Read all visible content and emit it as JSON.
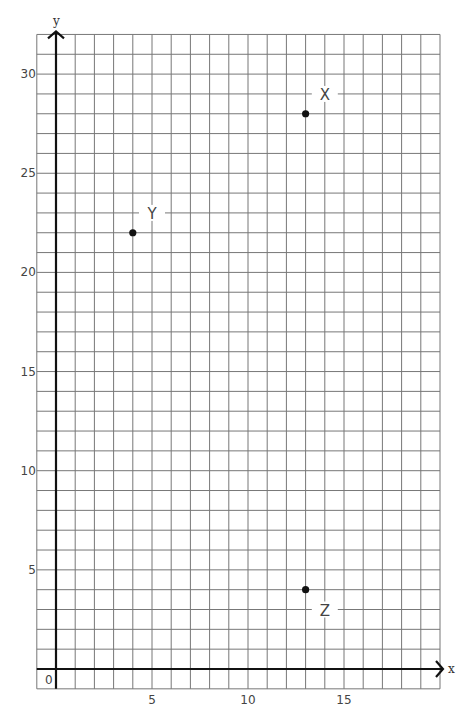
{
  "chart_data": {
    "type": "scatter",
    "title": "",
    "xlabel": "x",
    "ylabel": "y",
    "xlim": [
      -1,
      20
    ],
    "ylim": [
      -1,
      32
    ],
    "grid": true,
    "grid_step": 1,
    "origin_label": "0",
    "x_ticks": [
      5,
      10,
      15
    ],
    "y_ticks": [
      5,
      10,
      15,
      20,
      25,
      30
    ],
    "points": [
      {
        "label": "X",
        "x": 13,
        "y": 28,
        "label_x": 14,
        "label_y": 29
      },
      {
        "label": "Y",
        "x": 4,
        "y": 22,
        "label_x": 5,
        "label_y": 23
      },
      {
        "label": "Z",
        "x": 13,
        "y": 4,
        "label_x": 14,
        "label_y": 3
      }
    ],
    "colors": {
      "grid": "#777777",
      "axis": "#111111",
      "point": "#111111",
      "text": "#444444"
    }
  }
}
